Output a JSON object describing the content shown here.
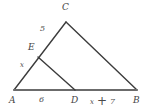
{
  "figure": {
    "type": "geometry-diagram",
    "width": 147,
    "height": 112,
    "background_color": "#ffffff",
    "stroke_color": "#3c3c3c",
    "baseline_color": "#6b6b6b",
    "vertices": {
      "A": {
        "label": "A",
        "x": 14,
        "y": 90
      },
      "B": {
        "label": "B",
        "x": 137,
        "y": 90
      },
      "C": {
        "label": "C",
        "x": 66,
        "y": 22
      },
      "D": {
        "label": "D",
        "x": 75,
        "y": 90
      },
      "E": {
        "label": "E",
        "x": 38,
        "y": 57
      }
    },
    "segments": [
      {
        "name": "AC",
        "from": "A",
        "to": "C"
      },
      {
        "name": "CB",
        "from": "C",
        "to": "B"
      },
      {
        "name": "AB",
        "from": "A",
        "to": "B"
      },
      {
        "name": "ED",
        "from": "E",
        "to": "D"
      }
    ],
    "measures": {
      "EC": "5",
      "AE": "x",
      "AD": "6",
      "DB_term": "x",
      "DB_operator": "+",
      "DB_value": "7"
    }
  }
}
